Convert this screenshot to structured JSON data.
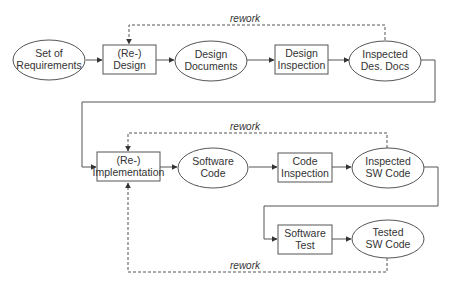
{
  "diagram": {
    "type": "process-flow",
    "colors": {
      "stroke": "#555555",
      "text": "#333333",
      "background": "#ffffff"
    },
    "nodes": [
      {
        "id": "requirements",
        "shape": "ellipse",
        "lines": [
          "Set of",
          "Requirements"
        ]
      },
      {
        "id": "design",
        "shape": "rect",
        "lines": [
          "(Re-)",
          "Design"
        ]
      },
      {
        "id": "design_docs",
        "shape": "ellipse",
        "lines": [
          "Design",
          "Documents"
        ]
      },
      {
        "id": "design_inspection",
        "shape": "rect",
        "lines": [
          "Design",
          "Inspection"
        ]
      },
      {
        "id": "inspected_des_docs",
        "shape": "ellipse",
        "lines": [
          "Inspected",
          "Des. Docs"
        ]
      },
      {
        "id": "implementation",
        "shape": "rect",
        "lines": [
          "(Re-)",
          "Implementation"
        ]
      },
      {
        "id": "software_code",
        "shape": "ellipse",
        "lines": [
          "Software",
          "Code"
        ]
      },
      {
        "id": "code_inspection",
        "shape": "rect",
        "lines": [
          "Code",
          "Inspection"
        ]
      },
      {
        "id": "inspected_sw_code",
        "shape": "ellipse",
        "lines": [
          "Inspected",
          "SW Code"
        ]
      },
      {
        "id": "software_test",
        "shape": "rect",
        "lines": [
          "Software",
          "Test"
        ]
      },
      {
        "id": "tested_sw_code",
        "shape": "ellipse",
        "lines": [
          "Tested",
          "SW Code"
        ]
      }
    ],
    "edges": [
      {
        "from": "requirements",
        "to": "design",
        "style": "solid"
      },
      {
        "from": "design",
        "to": "design_docs",
        "style": "solid"
      },
      {
        "from": "design_docs",
        "to": "design_inspection",
        "style": "solid"
      },
      {
        "from": "design_inspection",
        "to": "inspected_des_docs",
        "style": "solid"
      },
      {
        "from": "inspected_des_docs",
        "to": "design",
        "style": "dashed",
        "label": "rework"
      },
      {
        "from": "inspected_des_docs",
        "to": "implementation",
        "style": "solid"
      },
      {
        "from": "implementation",
        "to": "software_code",
        "style": "solid"
      },
      {
        "from": "software_code",
        "to": "code_inspection",
        "style": "solid"
      },
      {
        "from": "code_inspection",
        "to": "inspected_sw_code",
        "style": "solid"
      },
      {
        "from": "inspected_sw_code",
        "to": "implementation",
        "style": "dashed",
        "label": "rework"
      },
      {
        "from": "inspected_sw_code",
        "to": "software_test",
        "style": "solid"
      },
      {
        "from": "software_test",
        "to": "tested_sw_code",
        "style": "solid"
      },
      {
        "from": "tested_sw_code",
        "to": "implementation",
        "style": "dashed",
        "label": "rework"
      }
    ]
  }
}
